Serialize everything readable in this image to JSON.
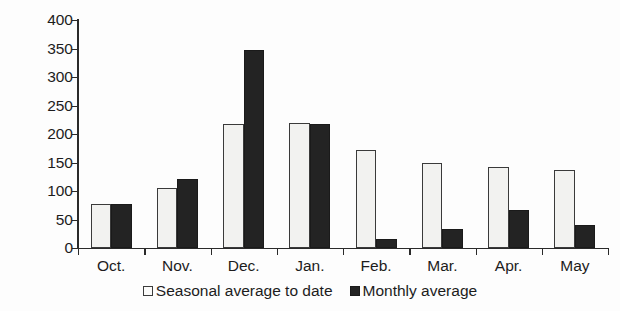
{
  "chart_data": {
    "type": "bar",
    "title": "",
    "subtitle": "",
    "xlabel": "",
    "ylabel": "Percentage",
    "ylim": [
      0,
      400
    ],
    "ytick_step": 50,
    "yticks": [
      0,
      50,
      100,
      150,
      200,
      250,
      300,
      350,
      400
    ],
    "ytick_labels": [
      "0",
      "50",
      "100",
      "150",
      "200",
      "250",
      "300",
      "350",
      "400"
    ],
    "grid": false,
    "legend_position": "bottom-center",
    "categories": [
      "Oct.",
      "Nov.",
      "Dec.",
      "Jan.",
      "Feb.",
      "Mar.",
      "Apr.",
      "May"
    ],
    "series": [
      {
        "name": "Seasonal average to date",
        "swatch": "seasonal",
        "color": "#f2f2f0",
        "edge_color": "#3a3a3a",
        "values": [
          77,
          106,
          217,
          220,
          172,
          150,
          143,
          137
        ]
      },
      {
        "name": "Monthly average",
        "swatch": "monthly",
        "color": "#232323",
        "edge_color": "#1a1a1a",
        "values": [
          77,
          121,
          348,
          217,
          16,
          34,
          66,
          40
        ]
      }
    ]
  },
  "figure": {
    "axis_color": "#2a2a2a",
    "background": "#fdfdfd"
  }
}
